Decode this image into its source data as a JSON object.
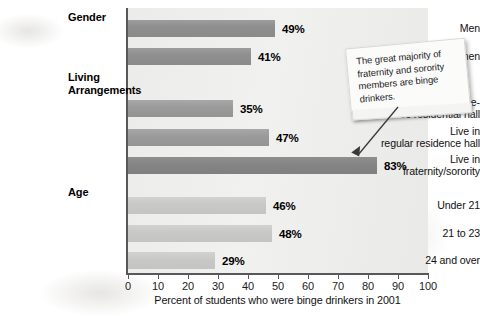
{
  "chart_data": {
    "type": "bar",
    "orientation": "horizontal",
    "title": "",
    "xlabel": "Percent of students who were binge drinkers in 2001",
    "ylabel": "",
    "xlim": [
      0,
      100
    ],
    "xticks": [
      "0",
      "10",
      "20",
      "30",
      "40",
      "50",
      "60",
      "70",
      "80",
      "90",
      "100"
    ],
    "grid": false,
    "legend": "none",
    "groups": [
      {
        "heading": "Gender",
        "heading_lines": [
          "Gender"
        ],
        "items": [
          {
            "label_lines": [
              "Men"
            ],
            "value": 49,
            "value_label": "49%",
            "shade": "bar-dark"
          },
          {
            "label_lines": [
              "Women"
            ],
            "value": 41,
            "value_label": "41%",
            "shade": "bar-dark"
          }
        ]
      },
      {
        "heading": "Living Arrangements",
        "heading_lines": [
          "Living",
          "Arrangements"
        ],
        "items": [
          {
            "label_lines": [
              "Live in substance-",
              "free residential hall"
            ],
            "value": 35,
            "value_label": "35%",
            "shade": "bar-mid"
          },
          {
            "label_lines": [
              "Live in",
              "regular residence hall"
            ],
            "value": 47,
            "value_label": "47%",
            "shade": "bar-mid"
          },
          {
            "label_lines": [
              "Live in",
              "fraternity/sorority"
            ],
            "value": 83,
            "value_label": "83%",
            "shade": "bar-deep"
          }
        ]
      },
      {
        "heading": "Age",
        "heading_lines": [
          "Age"
        ],
        "items": [
          {
            "label_lines": [
              "Under 21"
            ],
            "value": 46,
            "value_label": "46%",
            "shade": "bar-light"
          },
          {
            "label_lines": [
              "21 to 23"
            ],
            "value": 48,
            "value_label": "48%",
            "shade": "bar-light"
          },
          {
            "label_lines": [
              "24 and over"
            ],
            "value": 29,
            "value_label": "29%",
            "shade": "bar-light"
          }
        ]
      }
    ],
    "annotation": {
      "text": "The great majority of fraternity and sorority members are binge drinkers.",
      "points_to": "Live in fraternity/sorority"
    },
    "colors": {
      "plot_background": "#efefee",
      "axis": "#58585a",
      "bar_dark": "#919191",
      "bar_mid": "#9b9b9b",
      "bar_deep": "#868686",
      "bar_light": "#c9c9c7",
      "text": "#111111"
    }
  }
}
